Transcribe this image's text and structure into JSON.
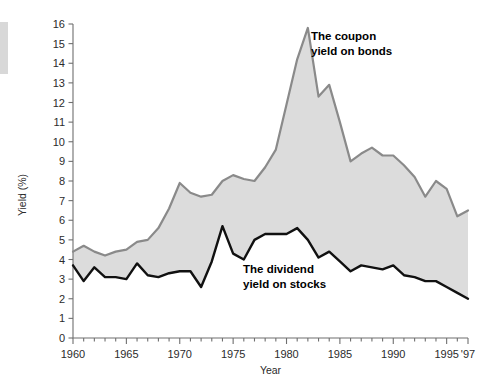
{
  "figure": {
    "background_color": "#ffffff",
    "edge_strip_color": "#d8d8d8"
  },
  "chart_data": {
    "type": "line",
    "title": "",
    "subtitle": "",
    "xlabel": "Year",
    "ylabel": "Yield (%)",
    "xlim": [
      1960,
      1997
    ],
    "ylim": [
      0,
      16
    ],
    "grid": false,
    "legend_position": "inline-annotations",
    "fill_between_series": true,
    "fill_color": "#dcdcdc",
    "x_tick_labels": [
      "1960",
      "1965",
      "1970",
      "1975",
      "1980",
      "1985",
      "1990",
      "1995",
      "'97"
    ],
    "x_tick_values": [
      1960,
      1965,
      1970,
      1975,
      1980,
      1985,
      1990,
      1995,
      1997
    ],
    "x_minor_tick_step": 1,
    "y_tick_labels": [
      "0",
      "1",
      "2",
      "3",
      "4",
      "5",
      "6",
      "7",
      "8",
      "9",
      "10",
      "11",
      "12",
      "13",
      "14",
      "15",
      "16"
    ],
    "y_tick_values": [
      0,
      1,
      2,
      3,
      4,
      5,
      6,
      7,
      8,
      9,
      10,
      11,
      12,
      13,
      14,
      15,
      16
    ],
    "x": [
      1960,
      1961,
      1962,
      1963,
      1964,
      1965,
      1966,
      1967,
      1968,
      1969,
      1970,
      1971,
      1972,
      1973,
      1974,
      1975,
      1976,
      1977,
      1978,
      1979,
      1980,
      1981,
      1982,
      1983,
      1984,
      1985,
      1986,
      1987,
      1988,
      1989,
      1990,
      1991,
      1992,
      1993,
      1994,
      1995,
      1996,
      1997
    ],
    "series": [
      {
        "name": "The coupon yield on bonds",
        "color": "#8a8a8a",
        "line_width": 2.2,
        "annotation": "The coupon\nyield on bonds",
        "values": [
          4.4,
          4.7,
          4.4,
          4.2,
          4.4,
          4.5,
          4.9,
          5.0,
          5.6,
          6.6,
          7.9,
          7.4,
          7.2,
          7.3,
          8.0,
          8.3,
          8.1,
          8.0,
          8.7,
          9.6,
          11.9,
          14.2,
          15.8,
          12.3,
          12.9,
          11.0,
          9.0,
          9.4,
          9.7,
          9.3,
          9.3,
          8.8,
          8.2,
          7.2,
          8.0,
          7.6,
          6.2,
          6.5
        ]
      },
      {
        "name": "The dividend yield on stocks",
        "color": "#111111",
        "line_width": 2.4,
        "annotation": "The dividend\nyield on stocks",
        "values": [
          3.7,
          2.9,
          3.6,
          3.1,
          3.1,
          3.0,
          3.8,
          3.2,
          3.1,
          3.3,
          3.4,
          3.4,
          2.6,
          3.9,
          5.7,
          4.3,
          4.0,
          5.0,
          5.3,
          5.3,
          5.3,
          5.6,
          5.0,
          4.1,
          4.4,
          3.9,
          3.4,
          3.7,
          3.6,
          3.5,
          3.7,
          3.2,
          3.1,
          2.9,
          2.9,
          2.6,
          2.3,
          2.0
        ]
      }
    ]
  }
}
